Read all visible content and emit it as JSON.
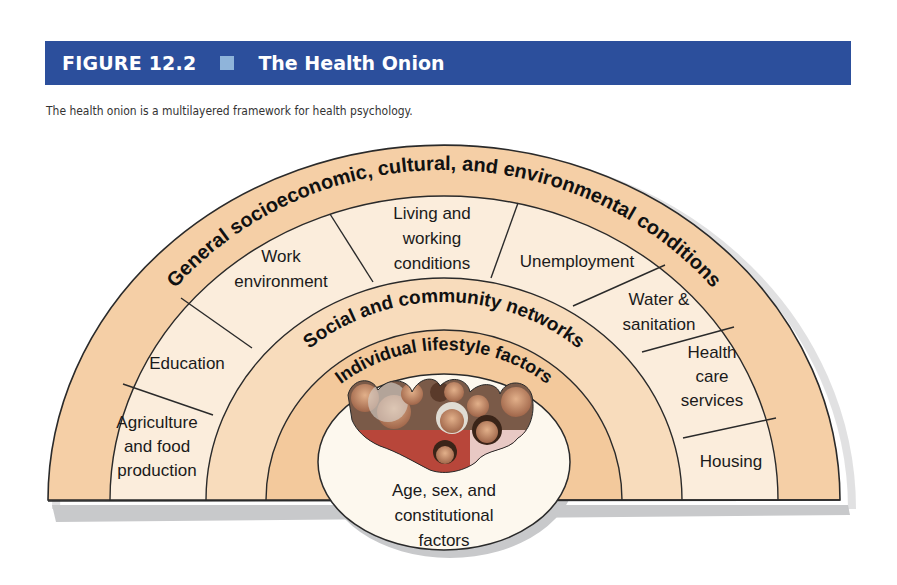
{
  "figure": {
    "number": "FIGURE 12.2",
    "title": "The Health Onion",
    "caption": "The health onion is a multilayered framework for health psychology.",
    "colors": {
      "title_bar": "#2c4f9c",
      "title_square": "#8fb4da",
      "outer_band": "#f5cfa6",
      "sector_band": "#fbeddc",
      "social_band": "#f8dcbc",
      "individual_band": "#f3c99c",
      "core_oval": "#fdf8ee",
      "shadow": "#c9cacc"
    }
  },
  "diagram": {
    "layers": [
      {
        "name": "General socioeconomic, cultural, and environmental conditions"
      },
      {
        "name": "Social and community networks"
      },
      {
        "name": "Individual lifestyle factors"
      }
    ],
    "sectors": {
      "agriculture": [
        "Agriculture",
        "and food",
        "production"
      ],
      "education": [
        "Education"
      ],
      "work": [
        "Work",
        "environment"
      ],
      "living": [
        "Living and",
        "working",
        "conditions"
      ],
      "unemployment": [
        "Unemployment"
      ],
      "water": [
        "Water &",
        "sanitation"
      ],
      "health": [
        "Health",
        "care",
        "services"
      ],
      "housing": [
        "Housing"
      ]
    },
    "core": {
      "lines": [
        "Age, sex, and",
        "constitutional",
        "factors"
      ],
      "image": "group-of-people-photo"
    }
  }
}
